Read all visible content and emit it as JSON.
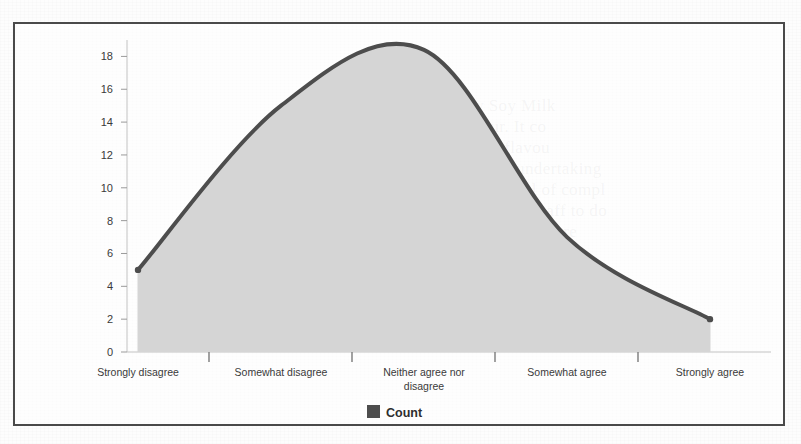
{
  "chart_data": {
    "type": "area",
    "title": "",
    "xlabel": "",
    "ylabel": "",
    "categories": [
      "Strongly disagree",
      "Somewhat disagree",
      "Neither agree nor disagree",
      "Somewhat agree",
      "Strongly agree"
    ],
    "series": [
      {
        "name": "Count",
        "values": [
          5,
          15,
          18.4,
          7,
          2
        ]
      }
    ],
    "values": [
      5,
      15,
      18.4,
      7,
      2
    ],
    "ylim": [
      0,
      19
    ],
    "yticks": [
      0,
      2,
      4,
      6,
      8,
      10,
      12,
      14,
      16,
      18
    ],
    "ytick_labels": [
      "0",
      "2",
      "4",
      "6",
      "8",
      "10",
      "12",
      "14",
      "16",
      "18"
    ],
    "grid": false,
    "smoothing": "spline",
    "legend": {
      "position": "bottom",
      "entries": [
        {
          "label": "Count",
          "color": "#4d4d4d"
        }
      ]
    },
    "colors": {
      "line": "#4d4d4d",
      "fill": "#d5d5d5",
      "axis": "#b8b8b8",
      "border": "#4a4a4a",
      "text": "#3a3a3a"
    }
  },
  "legend": {
    "entry_label": "Count"
  },
  "background_bleed": {
    "text": "sbury Soy Milk\nflavour. It co\nnot the flavou\nthe nature of its undertaking\nwithout a great deal of compl\nunusual for agency staff to do\nbut Sue thought there"
  }
}
